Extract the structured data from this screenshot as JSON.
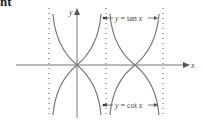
{
  "heading_fragment": "nt",
  "diagram": {
    "axes": {
      "x_label": "x",
      "y_label": "y"
    },
    "labels": {
      "tan": {
        "y": "y",
        "eq": " = tan ",
        "x": "x"
      },
      "cot": {
        "y": "y",
        "eq": " = cot ",
        "x": "x"
      }
    },
    "asymptotes_dotted": 3,
    "colors": {
      "curve": "#777777",
      "axis": "#777777",
      "dots": "#555555"
    }
  }
}
